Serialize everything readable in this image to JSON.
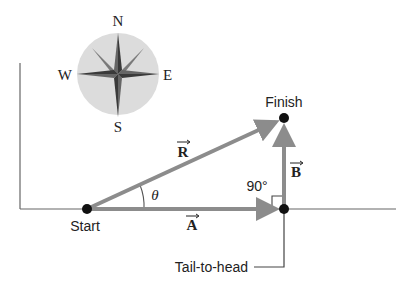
{
  "compass": {
    "north": "N",
    "south": "S",
    "east": "E",
    "west": "W"
  },
  "points": {
    "start": "Start",
    "finish": "Finish"
  },
  "vectors": {
    "resultant": "R",
    "a": "A",
    "b": "B"
  },
  "angles": {
    "theta": "θ",
    "right_angle": "90°"
  },
  "annotations": {
    "tail_to_head": "Tail-to-head"
  },
  "colors": {
    "vector": "#8c8c8c",
    "axis": "#555555",
    "dot": "#111111",
    "compass_disc": "#dcdcdc"
  }
}
